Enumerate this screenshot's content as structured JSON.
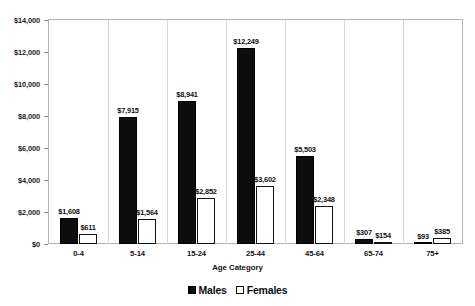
{
  "chart_data": {
    "type": "bar",
    "title": "",
    "xlabel": "Age Category",
    "ylabel": "",
    "ylim": [
      0,
      14000
    ],
    "ytick_step": 2000,
    "ytick_labels": [
      "$0",
      "$2,000",
      "$4,000",
      "$6,000",
      "$8,000",
      "$10,000",
      "$12,000",
      "$14,000"
    ],
    "ytick_values": [
      0,
      2000,
      4000,
      6000,
      8000,
      10000,
      12000,
      14000
    ],
    "grid": false,
    "legend_position": "bottom-center",
    "value_prefix": "$",
    "categories": [
      "0-4",
      "5-14",
      "15-24",
      "25-44",
      "45-64",
      "65-74",
      "75+"
    ],
    "series": [
      {
        "name": "Males",
        "color": "#0d0d0d",
        "fill": "solid-black",
        "values": [
          1608,
          7915,
          8941,
          12249,
          5503,
          307,
          93
        ],
        "labels": [
          "$1,608",
          "$7,915",
          "$8,941",
          "$12,249",
          "$5,503",
          "$307",
          "$93"
        ]
      },
      {
        "name": "Females",
        "color": "#ffffff",
        "fill": "white-dotted",
        "values": [
          611,
          1564,
          2852,
          3602,
          2348,
          154,
          385
        ],
        "labels": [
          "$611",
          "$1,564",
          "$2,852",
          "$3,602",
          "$2,348",
          "$154",
          "$385"
        ]
      }
    ]
  },
  "legend": {
    "items": [
      {
        "label": "Males",
        "swatch": "filled-square-icon"
      },
      {
        "label": "Females",
        "swatch": "outlined-square-icon"
      }
    ]
  },
  "axes": {
    "x_title": "Age Category"
  }
}
